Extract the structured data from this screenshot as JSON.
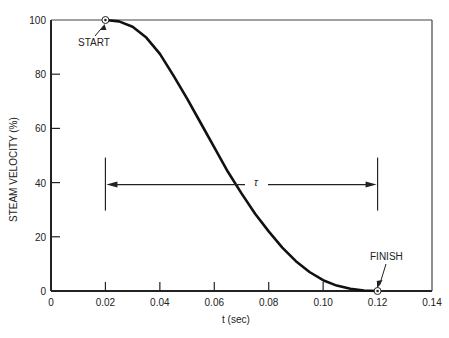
{
  "chart_data": {
    "type": "line",
    "title": "",
    "xlabel": "t (sec)",
    "ylabel": "STEAM VELOCITY (%)",
    "xlim": [
      0,
      0.14
    ],
    "ylim": [
      0,
      100
    ],
    "xticks": [
      "0",
      "0.02",
      "0.04",
      "0.06",
      "0.08",
      "0.10",
      "0.12",
      "0.14"
    ],
    "yticks": [
      "0",
      "20",
      "40",
      "60",
      "80",
      "100"
    ],
    "grid": false,
    "series": [
      {
        "name": "Steam velocity",
        "x": [
          0.02,
          0.025,
          0.03,
          0.035,
          0.04,
          0.045,
          0.05,
          0.055,
          0.06,
          0.065,
          0.07,
          0.075,
          0.08,
          0.085,
          0.09,
          0.095,
          0.1,
          0.105,
          0.11,
          0.115,
          0.12
        ],
        "y": [
          100,
          99.5,
          97.5,
          93.5,
          87.5,
          79.5,
          71,
          62,
          53,
          44,
          36,
          28.5,
          22,
          16,
          11,
          7,
          4,
          2,
          0.8,
          0.2,
          0
        ]
      }
    ],
    "annotations": [
      {
        "text": "START",
        "x": 0.02,
        "y": 100
      },
      {
        "text": "FINISH",
        "x": 0.12,
        "y": 0
      },
      {
        "text": "τ",
        "type": "span-arrow",
        "x_from": 0.02,
        "x_to": 0.12,
        "y": 40
      }
    ]
  },
  "labels": {
    "start": "START",
    "finish": "FINISH",
    "tau": "τ",
    "xlabel": "t (sec)",
    "ylabel": "STEAM VELOCITY (%)"
  }
}
